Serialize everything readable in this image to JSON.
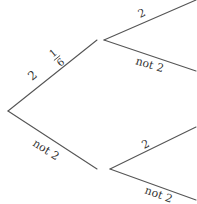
{
  "diagram": {
    "type": "probability-tree",
    "colors": {
      "line": "#555555",
      "text": "#333333",
      "background": "#ffffff"
    },
    "level1": {
      "upper": {
        "label": "2",
        "probability": {
          "numerator": "1",
          "denominator": "6"
        }
      },
      "lower": {
        "label": "not 2"
      }
    },
    "level2": {
      "from_upper": {
        "upper": {
          "label": "2"
        },
        "lower": {
          "label": "not 2"
        }
      },
      "from_lower": {
        "upper": {
          "label": "2"
        },
        "lower": {
          "label": "not 2"
        }
      }
    }
  }
}
